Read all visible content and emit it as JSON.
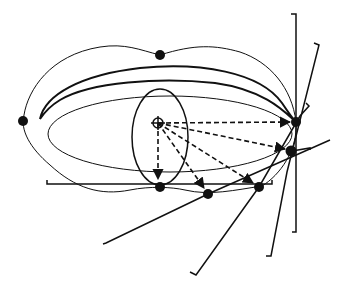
{
  "diagram": {
    "elements": {
      "outer_curve": "peanut-shaped closed curve",
      "crescent": "thick crescent band",
      "inner_ellipse": "wide inner ellipse",
      "small_ellipse": "small vertical ellipse around center",
      "center_marker": "crosshair circle (origin point)",
      "tangent_points": 7,
      "dashed_arrows": 5,
      "tangent_lines": 6
    },
    "colors": {
      "ink": "#111111",
      "background": "#ffffff"
    }
  }
}
